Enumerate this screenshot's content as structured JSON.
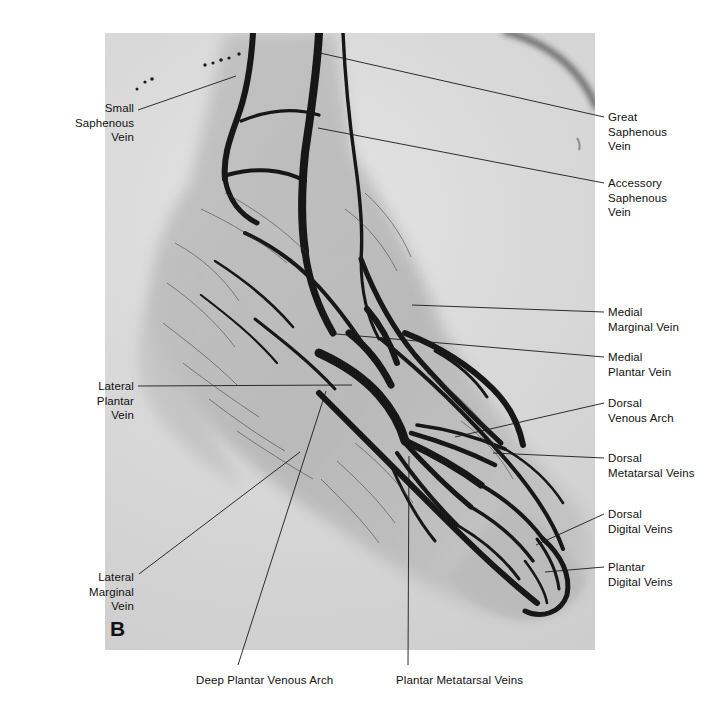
{
  "figure": {
    "panel_letter": "B",
    "modality": "venogram",
    "region": "foot and ankle"
  },
  "radiograph": {
    "x": 105,
    "y": 33,
    "width": 490,
    "height": 617,
    "background_color": "#d2d2d2",
    "vessel_color": "#151515"
  },
  "labels": [
    {
      "id": "small-saphenous-vein",
      "text": "Small\nSaphenous\nVein",
      "side": "left",
      "box": {
        "x": 46,
        "y": 101,
        "width": 88
      },
      "leader": {
        "x1": 138,
        "y1": 110,
        "x2": 236,
        "y2": 76
      }
    },
    {
      "id": "great-saphenous-vein",
      "text": "Great\nSaphenous\nVein",
      "side": "right",
      "box": {
        "x": 608,
        "y": 110,
        "width": 100
      },
      "leader": {
        "x1": 604,
        "y1": 117,
        "x2": 320,
        "y2": 53
      }
    },
    {
      "id": "accessory-saphenous-vein",
      "text": "Accessory\nSaphenous\nVein",
      "side": "right",
      "box": {
        "x": 608,
        "y": 176,
        "width": 100
      },
      "leader": {
        "x1": 604,
        "y1": 183,
        "x2": 318,
        "y2": 128
      }
    },
    {
      "id": "medial-marginal-vein",
      "text": "Medial\nMarginal Vein",
      "side": "right",
      "box": {
        "x": 608,
        "y": 305,
        "width": 100
      },
      "leader": {
        "x1": 604,
        "y1": 312,
        "x2": 412,
        "y2": 305
      }
    },
    {
      "id": "medial-plantar-vein",
      "text": "Medial\nPlantar Vein",
      "side": "right",
      "box": {
        "x": 608,
        "y": 350,
        "width": 100
      },
      "leader": {
        "x1": 604,
        "y1": 357,
        "x2": 336,
        "y2": 334
      }
    },
    {
      "id": "dorsal-venous-arch",
      "text": "Dorsal\nVenous Arch",
      "side": "right",
      "box": {
        "x": 608,
        "y": 396,
        "width": 100
      },
      "leader": {
        "x1": 604,
        "y1": 403,
        "x2": 455,
        "y2": 437
      }
    },
    {
      "id": "dorsal-metatarsal-veins",
      "text": "Dorsal\nMetatarsal Veins",
      "side": "right",
      "box": {
        "x": 608,
        "y": 451,
        "width": 104
      },
      "leader": {
        "x1": 604,
        "y1": 458,
        "x2": 493,
        "y2": 453
      }
    },
    {
      "id": "dorsal-digital-veins",
      "text": "Dorsal\nDigital Veins",
      "side": "right",
      "box": {
        "x": 608,
        "y": 507,
        "width": 100
      },
      "leader": {
        "x1": 604,
        "y1": 514,
        "x2": 536,
        "y2": 545
      }
    },
    {
      "id": "plantar-digital-veins",
      "text": "Plantar\nDigital Veins",
      "side": "right",
      "box": {
        "x": 608,
        "y": 560,
        "width": 100
      },
      "leader": {
        "x1": 604,
        "y1": 567,
        "x2": 545,
        "y2": 572
      }
    },
    {
      "id": "lateral-plantar-vein",
      "text": "Lateral\nPlantar\nVein",
      "side": "left",
      "box": {
        "x": 46,
        "y": 379,
        "width": 88
      },
      "leader": {
        "x1": 138,
        "y1": 386,
        "x2": 352,
        "y2": 385
      }
    },
    {
      "id": "lateral-marginal-vein",
      "text": "Lateral\nMarginal\nVein",
      "side": "left",
      "box": {
        "x": 46,
        "y": 570,
        "width": 88
      },
      "leader": {
        "x1": 139,
        "y1": 574,
        "x2": 300,
        "y2": 452
      }
    },
    {
      "id": "deep-plantar-venous-arch",
      "text": "Deep Plantar Venous Arch",
      "side": "center",
      "box": {
        "x": 196,
        "y": 673,
        "width": 160
      },
      "leader": {
        "x1": 238,
        "y1": 665,
        "x2": 326,
        "y2": 391
      }
    },
    {
      "id": "plantar-metatarsal-veins",
      "text": "Plantar Metatarsal Veins",
      "side": "center",
      "box": {
        "x": 396,
        "y": 673,
        "width": 160
      },
      "leader": {
        "x1": 408,
        "y1": 665,
        "x2": 409,
        "y2": 456
      }
    }
  ]
}
